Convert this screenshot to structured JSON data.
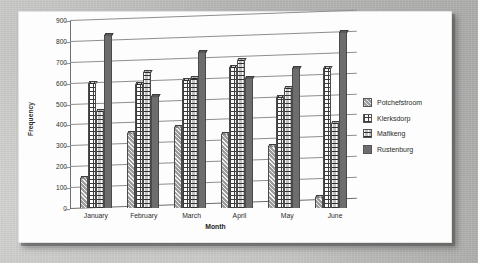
{
  "chart_data": {
    "type": "bar",
    "title": "",
    "xlabel": "Month",
    "ylabel": "Frequency",
    "ylim": [
      0,
      900
    ],
    "yticks": [
      900,
      800,
      700,
      600,
      500,
      400,
      300,
      200,
      100,
      0
    ],
    "grid": true,
    "legend_position": "right",
    "categories": [
      "January",
      "February",
      "March",
      "April",
      "May",
      "June"
    ],
    "series": [
      {
        "name": "Potchefstroom",
        "pattern": "solid-gray-hatch",
        "color": "#9d9d9d",
        "values": [
          145,
          360,
          390,
          352,
          298,
          55
        ]
      },
      {
        "name": "Klerksdorp",
        "pattern": "white-grid",
        "color": "#fbfbfb",
        "values": [
          600,
          592,
          615,
          673,
          530,
          668
        ]
      },
      {
        "name": "Mafikeng",
        "pattern": "gray-dotted-grid",
        "color": "#c2c2c2",
        "values": [
          465,
          650,
          622,
          710,
          575,
          405
        ]
      },
      {
        "name": "Rustenburg",
        "pattern": "solid-dark",
        "color": "#6d6d6d",
        "values": [
          830,
          535,
          748,
          622,
          672,
          845
        ]
      }
    ]
  },
  "legend": {
    "items": [
      {
        "label": "Potchefstroom"
      },
      {
        "label": "Klerksdorp"
      },
      {
        "label": "Mafikeng"
      },
      {
        "label": "Rustenburg"
      }
    ]
  }
}
